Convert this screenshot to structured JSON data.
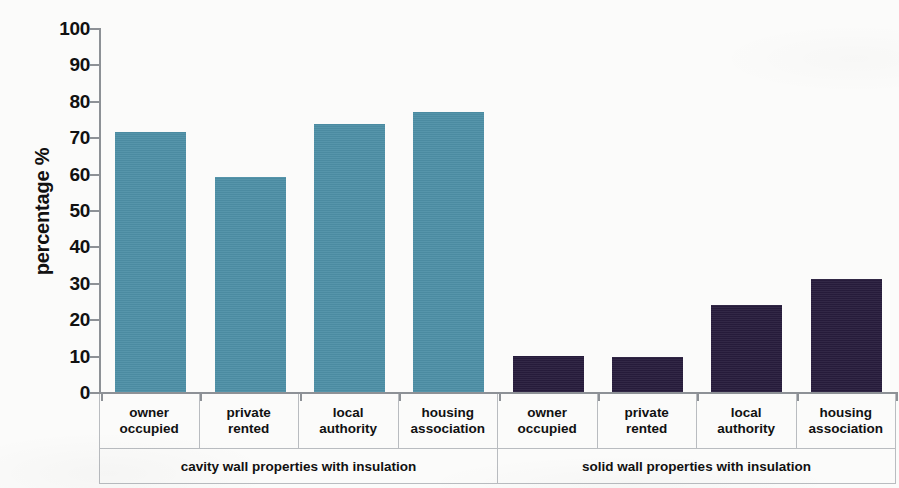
{
  "chart_data": {
    "type": "bar",
    "title": "",
    "xlabel": "",
    "ylabel": "percentage %",
    "ylim": [
      0,
      100
    ],
    "yticks": [
      0,
      10,
      20,
      30,
      40,
      50,
      60,
      70,
      80,
      90,
      100
    ],
    "grid": false,
    "legend": "none",
    "categories": [
      "owner occupied",
      "private rented",
      "local authority",
      "housing association",
      "owner occupied",
      "private rented",
      "local authority",
      "housing association"
    ],
    "values": [
      71.5,
      59,
      73.5,
      77,
      10,
      9.5,
      24,
      31
    ],
    "groups": [
      {
        "label": "cavity wall properties with insulation",
        "color": "#4d8fa6",
        "categories": [
          "owner occupied",
          "private rented",
          "local authority",
          "housing association"
        ],
        "values": [
          71.5,
          59,
          73.5,
          77
        ]
      },
      {
        "label": "solid wall properties with insulation",
        "color": "#271c3c",
        "categories": [
          "owner occupied",
          "private rented",
          "local authority",
          "housing association"
        ],
        "values": [
          10,
          9.5,
          24,
          31
        ]
      }
    ]
  },
  "axis": {
    "y_label": "percentage %",
    "y_ticks": [
      "100",
      "90",
      "80",
      "70",
      "60",
      "50",
      "40",
      "30",
      "20",
      "10",
      "0"
    ]
  },
  "bars": [
    {
      "label_line1": "owner",
      "label_line2": "occupied",
      "value": 71.5,
      "color": "#4d8fa6",
      "group": 0
    },
    {
      "label_line1": "private",
      "label_line2": "rented",
      "value": 59,
      "color": "#4d8fa6",
      "group": 0
    },
    {
      "label_line1": "local",
      "label_line2": "authority",
      "value": 73.5,
      "color": "#4d8fa6",
      "group": 0
    },
    {
      "label_line1": "housing",
      "label_line2": "association",
      "value": 77,
      "color": "#4d8fa6",
      "group": 0
    },
    {
      "label_line1": "owner",
      "label_line2": "occupied",
      "value": 10,
      "color": "#271c3c",
      "group": 1
    },
    {
      "label_line1": "private",
      "label_line2": "rented",
      "value": 9.5,
      "color": "#271c3c",
      "group": 1
    },
    {
      "label_line1": "local",
      "label_line2": "authority",
      "value": 24,
      "color": "#271c3c",
      "group": 1
    },
    {
      "label_line1": "housing",
      "label_line2": "association",
      "value": 31,
      "color": "#271c3c",
      "group": 1
    }
  ],
  "group_labels": [
    "cavity wall properties with insulation",
    "solid wall properties with insulation"
  ],
  "title_sliver": "",
  "colors": {
    "cavity_wall": "#4d8fa6",
    "solid_wall": "#271c3c",
    "axis": "#8d9196",
    "text": "#111111",
    "background": "#fbfbfa"
  }
}
